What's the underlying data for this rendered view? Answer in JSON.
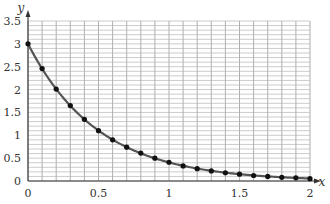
{
  "chart_data": {
    "type": "line",
    "title": "",
    "xlabel": "x",
    "ylabel": "y",
    "xlim": [
      0,
      2
    ],
    "ylim": [
      0,
      3.5
    ],
    "grid": true,
    "legend": null,
    "x_ticks": [
      {
        "value": 0,
        "label": "0"
      },
      {
        "value": 0.5,
        "label": "0.5"
      },
      {
        "value": 1,
        "label": "1"
      },
      {
        "value": 1.5,
        "label": "1.5"
      },
      {
        "value": 2,
        "label": "2"
      }
    ],
    "y_ticks": [
      {
        "value": 0,
        "label": "0"
      },
      {
        "value": 0.5,
        "label": "0.5"
      },
      {
        "value": 1,
        "label": "1"
      },
      {
        "value": 1.5,
        "label": "1.5"
      },
      {
        "value": 2,
        "label": "2"
      },
      {
        "value": 2.5,
        "label": "2.5"
      },
      {
        "value": 3,
        "label": "3"
      },
      {
        "value": 3.5,
        "label": "3.5"
      }
    ],
    "series": [
      {
        "name": "y = 3e^(-2x)",
        "color": "#555555",
        "marker_color": "#111111",
        "x": [
          0,
          0.1,
          0.2,
          0.3,
          0.4,
          0.5,
          0.6,
          0.7,
          0.8,
          0.9,
          1.0,
          1.1,
          1.2,
          1.3,
          1.4,
          1.5,
          1.6,
          1.7,
          1.8,
          1.9,
          2.0
        ],
        "y": [
          3.0,
          2.46,
          2.01,
          1.65,
          1.35,
          1.1,
          0.9,
          0.74,
          0.61,
          0.5,
          0.41,
          0.33,
          0.27,
          0.22,
          0.18,
          0.15,
          0.12,
          0.1,
          0.08,
          0.07,
          0.05
        ]
      }
    ]
  }
}
